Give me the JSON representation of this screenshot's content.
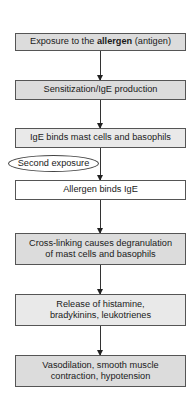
{
  "diagram": {
    "type": "flowchart",
    "direction": "top-to-bottom",
    "steps": [
      {
        "pre": "Exposure to the ",
        "bold": "allergen",
        "post": " (antigen)",
        "fill": "#dcdcdc"
      },
      {
        "text": "Sensitization/IgE production",
        "fill": "#dcdcdc"
      },
      {
        "text": "IgE binds mast cells and basophils",
        "fill": "#e9e9e9"
      },
      {
        "text": "Allergen binds IgE",
        "fill": "#ffffff"
      },
      {
        "line1": "Cross-linking causes degranulation",
        "line2": "of mast cells and basophils",
        "fill": "#dcdcdc"
      },
      {
        "line1": "Release of histamine,",
        "line2": "bradykinins, leukotrienes",
        "fill": "#e9e9e9"
      },
      {
        "line1": "Vasodilation, smooth muscle",
        "line2": "contraction, hypotension",
        "fill": "#dcdcdc"
      }
    ],
    "side_label": {
      "text": "Second exposure",
      "shape": "ellipse",
      "attached_to_edge": "step3-to-step4"
    },
    "edges": [
      {
        "from": 0,
        "to": 1
      },
      {
        "from": 1,
        "to": 2
      },
      {
        "from": 2,
        "to": 3
      },
      {
        "from": 3,
        "to": 4
      },
      {
        "from": 4,
        "to": 5
      },
      {
        "from": 5,
        "to": 6
      }
    ]
  }
}
